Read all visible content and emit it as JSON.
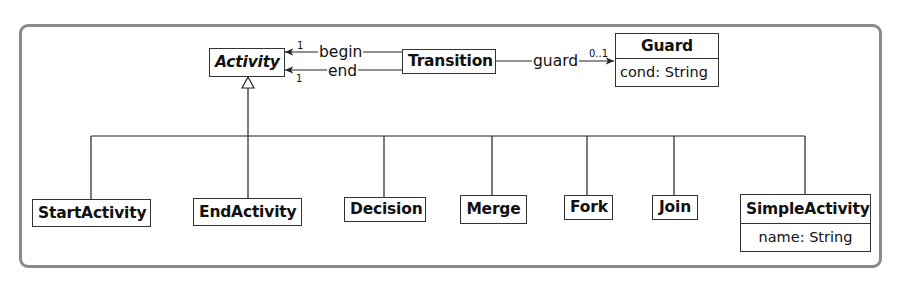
{
  "diagram": {
    "type": "UML class diagram",
    "classes": {
      "activity": {
        "name": "Activity",
        "abstract": true
      },
      "transition": {
        "name": "Transition"
      },
      "guard": {
        "name": "Guard",
        "attributes": [
          "cond: String"
        ]
      },
      "start_activity": {
        "name": "StartActivity"
      },
      "end_activity": {
        "name": "EndActivity"
      },
      "decision": {
        "name": "Decision"
      },
      "merge": {
        "name": "Merge"
      },
      "fork": {
        "name": "Fork"
      },
      "join": {
        "name": "Join"
      },
      "simple_activity": {
        "name": "SimpleActivity",
        "attributes": [
          "name: String"
        ]
      }
    },
    "associations": {
      "begin": {
        "label": "begin",
        "from": "Transition",
        "to": "Activity",
        "multiplicity": "1"
      },
      "end": {
        "label": "end",
        "from": "Transition",
        "to": "Activity",
        "multiplicity": "1"
      },
      "guard": {
        "label": "guard",
        "from": "Transition",
        "to": "Guard",
        "multiplicity": "0..1"
      }
    },
    "generalization": {
      "parent": "Activity",
      "children": [
        "StartActivity",
        "EndActivity",
        "Decision",
        "Merge",
        "Fork",
        "Join",
        "SimpleActivity"
      ]
    }
  }
}
